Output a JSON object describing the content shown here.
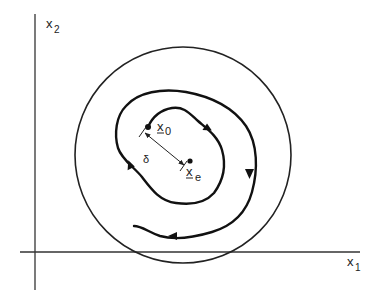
{
  "figure": {
    "type": "stability-phase-portrait",
    "axes": {
      "x_label": "x",
      "x_subscript": "1",
      "y_label": "x",
      "y_subscript": "2"
    },
    "points": {
      "initial": {
        "label": "x",
        "subscript": "0",
        "underlined": true
      },
      "equilibrium": {
        "label": "x",
        "subscript": "e",
        "underlined": true
      }
    },
    "distance_label": "δ",
    "elements": [
      "outer-circle-region",
      "spiral-trajectory-with-arrows",
      "delta-distance-marker"
    ],
    "colors": {
      "ink": "#222222",
      "background": "#ffffff"
    }
  }
}
